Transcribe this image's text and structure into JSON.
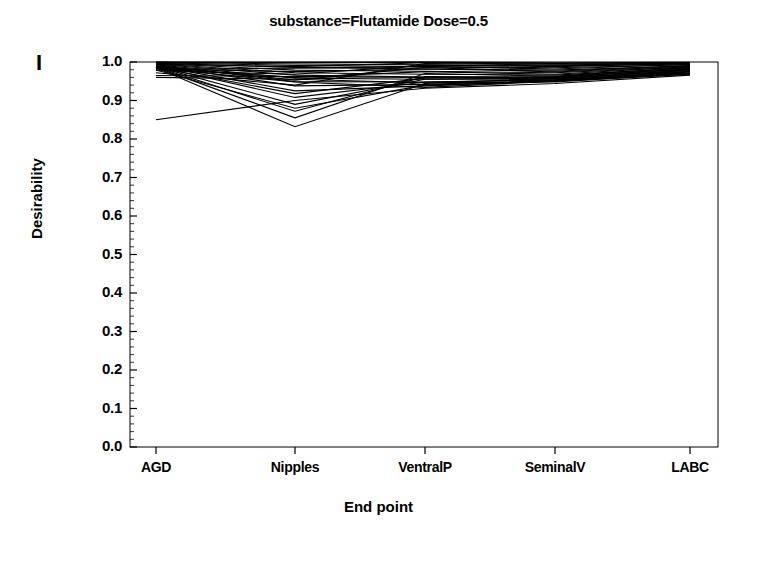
{
  "panel": {
    "letter": "I"
  },
  "chart_data": {
    "type": "line",
    "title": "substance=Flutamide  Dose=0.5",
    "xlabel": "End point",
    "ylabel": "Desirability",
    "categories": [
      "AGD",
      "Nipples",
      "VentralP",
      "SeminalV",
      "LABC"
    ],
    "ylim": [
      0.0,
      1.0
    ],
    "yticks": [
      "0.0",
      "0.1",
      "0.2",
      "0.3",
      "0.4",
      "0.5",
      "0.6",
      "0.7",
      "0.8",
      "0.9",
      "1.0"
    ],
    "ytick_values": [
      0.0,
      0.1,
      0.2,
      0.3,
      0.4,
      0.5,
      0.6,
      0.7,
      0.8,
      0.9,
      1.0
    ],
    "grid": false,
    "legend": "none",
    "minor_ticks_per_interval": 5,
    "line_color": "#000000",
    "series": [
      {
        "name": "run-01",
        "values": [
          1.0,
          0.998,
          0.999,
          0.996,
          0.998
        ]
      },
      {
        "name": "run-02",
        "values": [
          0.999,
          0.995,
          0.993,
          0.99,
          0.995
        ]
      },
      {
        "name": "run-03",
        "values": [
          0.998,
          0.991,
          0.988,
          0.985,
          0.993
        ]
      },
      {
        "name": "run-04",
        "values": [
          0.997,
          0.986,
          0.982,
          0.979,
          0.99
        ]
      },
      {
        "name": "run-05",
        "values": [
          0.996,
          0.979,
          0.976,
          0.972,
          0.987
        ]
      },
      {
        "name": "run-06",
        "values": [
          0.995,
          0.972,
          0.968,
          0.966,
          0.984
        ]
      },
      {
        "name": "run-07",
        "values": [
          0.994,
          0.966,
          0.961,
          0.96,
          0.981
        ]
      },
      {
        "name": "run-08",
        "values": [
          0.993,
          0.958,
          0.955,
          0.956,
          0.978
        ]
      },
      {
        "name": "run-09",
        "values": [
          0.992,
          0.949,
          0.948,
          0.954,
          0.975
        ]
      },
      {
        "name": "run-10",
        "values": [
          0.991,
          0.938,
          0.942,
          0.952,
          0.972
        ]
      },
      {
        "name": "run-11",
        "values": [
          0.99,
          0.925,
          0.938,
          0.951,
          0.97
        ]
      },
      {
        "name": "run-12",
        "values": [
          0.989,
          0.908,
          0.948,
          0.953,
          0.974
        ]
      },
      {
        "name": "run-13",
        "values": [
          0.988,
          0.89,
          0.955,
          0.957,
          0.979
        ]
      },
      {
        "name": "run-14",
        "values": [
          0.987,
          0.872,
          0.962,
          0.96,
          0.983
        ]
      },
      {
        "name": "run-15",
        "values": [
          0.986,
          0.855,
          0.97,
          0.963,
          0.986
        ]
      },
      {
        "name": "run-16",
        "values": [
          0.985,
          0.832,
          0.944,
          0.958,
          0.976
        ]
      },
      {
        "name": "run-17",
        "values": [
          0.984,
          0.948,
          0.934,
          0.95,
          0.968
        ]
      },
      {
        "name": "run-18",
        "values": [
          0.983,
          0.96,
          0.975,
          0.968,
          0.988
        ]
      },
      {
        "name": "run-19",
        "values": [
          0.982,
          0.975,
          0.982,
          0.976,
          0.991
        ]
      },
      {
        "name": "run-20",
        "values": [
          0.981,
          0.984,
          0.988,
          0.982,
          0.994
        ]
      },
      {
        "name": "run-21",
        "values": [
          0.978,
          0.968,
          0.992,
          0.988,
          0.996
        ]
      },
      {
        "name": "run-22",
        "values": [
          0.972,
          0.94,
          0.996,
          0.992,
          0.997
        ]
      },
      {
        "name": "run-23",
        "values": [
          0.965,
          0.962,
          0.96,
          0.955,
          0.98
        ]
      },
      {
        "name": "run-24",
        "values": [
          0.96,
          0.955,
          0.946,
          0.948,
          0.969
        ]
      },
      {
        "name": "run-25",
        "values": [
          0.85,
          0.9,
          0.932,
          0.944,
          0.966
        ]
      },
      {
        "name": "run-26",
        "values": [
          0.999,
          0.999,
          1.0,
          0.998,
          0.999
        ]
      },
      {
        "name": "run-27",
        "values": [
          0.994,
          0.988,
          0.998,
          0.994,
          0.997
        ]
      },
      {
        "name": "run-28",
        "values": [
          0.99,
          0.953,
          0.986,
          0.974,
          0.989
        ]
      },
      {
        "name": "run-29",
        "values": [
          0.986,
          0.918,
          0.958,
          0.962,
          0.982
        ]
      },
      {
        "name": "run-30",
        "values": [
          0.979,
          0.88,
          0.94,
          0.95,
          0.971
        ]
      }
    ]
  }
}
